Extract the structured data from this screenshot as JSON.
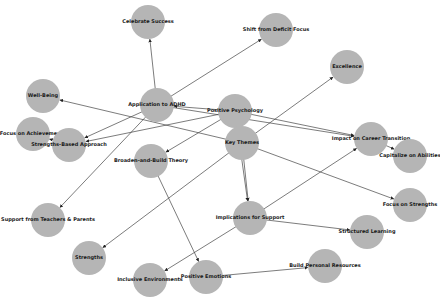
{
  "diagram": {
    "type": "directed-graph",
    "node_color": "#b5b5b5",
    "edge_color": "#444444",
    "node_radius": 17,
    "nodes": [
      {
        "id": "celebrate_success",
        "label": "Celebrate Success",
        "x": 148,
        "y": 22
      },
      {
        "id": "shift_deficit",
        "label": "Shift from Deficit Focus",
        "x": 276,
        "y": 30
      },
      {
        "id": "excellence",
        "label": "Excellence",
        "x": 347,
        "y": 67
      },
      {
        "id": "well_being",
        "label": "Well-Being",
        "x": 43,
        "y": 96
      },
      {
        "id": "application_adhd",
        "label": "Application to ADHD",
        "x": 157,
        "y": 105
      },
      {
        "id": "positive_psychology",
        "label": "Positive Psychology",
        "x": 235,
        "y": 111
      },
      {
        "id": "focus_achievements",
        "label": "Focus on Achievements",
        "x": 33,
        "y": 134
      },
      {
        "id": "strengths_based",
        "label": "Strengths-Based Approach",
        "x": 69,
        "y": 145
      },
      {
        "id": "key_themes",
        "label": "Key Themes",
        "x": 242,
        "y": 143
      },
      {
        "id": "impact_career",
        "label": "Impact on Career Transition",
        "x": 371,
        "y": 139
      },
      {
        "id": "capitalize_abilities",
        "label": "Capitalize on Abilities",
        "x": 410,
        "y": 156
      },
      {
        "id": "broaden_build",
        "label": "Broaden-and-Build Theory",
        "x": 151,
        "y": 161
      },
      {
        "id": "focus_strengths",
        "label": "Focus on Strengths",
        "x": 410,
        "y": 205
      },
      {
        "id": "support_teachers",
        "label": "Support from Teachers & Parents",
        "x": 48,
        "y": 220
      },
      {
        "id": "implications_support",
        "label": "Implications for Support",
        "x": 250,
        "y": 218
      },
      {
        "id": "structured_learning",
        "label": "Structured Learning",
        "x": 367,
        "y": 232
      },
      {
        "id": "strengths",
        "label": "Strengths",
        "x": 89,
        "y": 258
      },
      {
        "id": "inclusive_env",
        "label": "Inclusive Environments",
        "x": 150,
        "y": 280
      },
      {
        "id": "positive_emotions",
        "label": "Positive Emotions",
        "x": 206,
        "y": 277
      },
      {
        "id": "build_resources",
        "label": "Build Personal Resources",
        "x": 325,
        "y": 266
      }
    ],
    "edges": [
      {
        "from": "application_adhd",
        "to": "shift_deficit"
      },
      {
        "from": "application_adhd",
        "to": "strengths_based"
      },
      {
        "from": "application_adhd",
        "to": "support_teachers"
      },
      {
        "from": "application_adhd",
        "to": "celebrate_success"
      },
      {
        "from": "application_adhd",
        "to": "impact_career"
      },
      {
        "from": "positive_psychology",
        "to": "application_adhd"
      },
      {
        "from": "positive_psychology",
        "to": "strengths_based"
      },
      {
        "from": "positive_psychology",
        "to": "broaden_build"
      },
      {
        "from": "positive_psychology",
        "to": "implications_support"
      },
      {
        "from": "positive_psychology",
        "to": "impact_career"
      },
      {
        "from": "key_themes",
        "to": "well_being"
      },
      {
        "from": "key_themes",
        "to": "excellence"
      },
      {
        "from": "key_themes",
        "to": "strengths"
      },
      {
        "from": "key_themes",
        "to": "implications_support"
      },
      {
        "from": "key_themes",
        "to": "focus_strengths"
      },
      {
        "from": "strengths_based",
        "to": "focus_achievements"
      },
      {
        "from": "impact_career",
        "to": "capitalize_abilities"
      },
      {
        "from": "broaden_build",
        "to": "positive_emotions"
      },
      {
        "from": "positive_emotions",
        "to": "build_resources"
      },
      {
        "from": "implications_support",
        "to": "structured_learning"
      },
      {
        "from": "implications_support",
        "to": "inclusive_env"
      },
      {
        "from": "implications_support",
        "to": "impact_career"
      }
    ]
  }
}
